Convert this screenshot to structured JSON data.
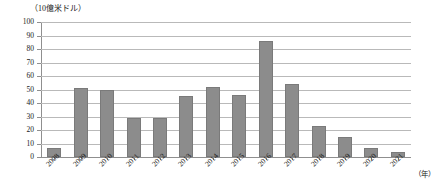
{
  "chart_data": {
    "type": "bar",
    "title": "",
    "subtitle": "",
    "unit_label": "（10億米ドル）",
    "xlabel": "（年）",
    "ylabel": "",
    "ylim": [
      0,
      100
    ],
    "ytick_step": 10,
    "grid": true,
    "legend": "none",
    "bar_color": "#8c8c8c",
    "categories": [
      "2008",
      "2009",
      "2010",
      "2011",
      "2012",
      "2013",
      "2014",
      "2015",
      "2016",
      "2017",
      "2018",
      "2019",
      "2020",
      "2021"
    ],
    "values": [
      7,
      51,
      50,
      29,
      29,
      45,
      52,
      46,
      86,
      54,
      23,
      15,
      7,
      4
    ],
    "yticks": [
      "0",
      "10",
      "20",
      "30",
      "40",
      "50",
      "60",
      "70",
      "80",
      "90",
      "100"
    ]
  }
}
